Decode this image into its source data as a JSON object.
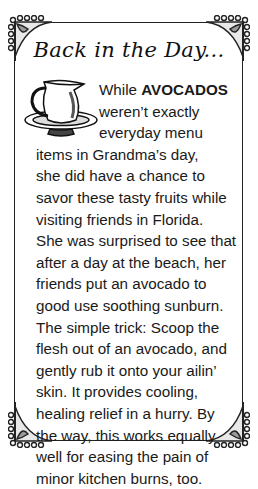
{
  "title": "Back in the Day...",
  "illustration": "pitcher-and-basin-icon",
  "article": {
    "lead_word": "While",
    "highlight": "AVOCADOS",
    "lines": [
      "weren’t exactly",
      "everyday menu",
      "items in Grandma’s day,",
      "she did have a chance to",
      "savor these tasty fruits while",
      "visiting friends in Florida.",
      "She was surprised to see that",
      "after a day at the beach, her",
      "friends put an avocado to",
      "good use soothing sunburn.",
      "The simple trick: Scoop the",
      "flesh out of an avocado, and",
      "gently rub it onto your ailin’",
      "skin. It provides cooling,",
      "healing relief in a hurry. By",
      "the way, this works equally",
      "well for easing the pain of",
      "minor kitchen burns, too."
    ]
  },
  "colors": {
    "ink": "#1a1a1a",
    "background": "#ffffff"
  }
}
